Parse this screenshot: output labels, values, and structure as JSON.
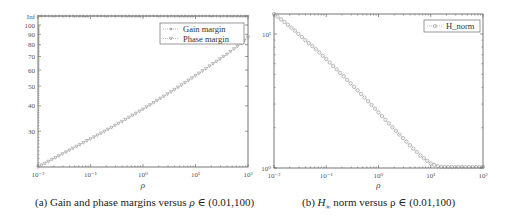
{
  "chart_data": [
    {
      "type": "line",
      "id": "a",
      "title": "",
      "caption": "(a) Gain and phase margins versus ρ ∈ (0.01,100)",
      "xlabel": "ρ",
      "ylabel": "",
      "xscale": "log",
      "yscale": "log",
      "xlim": [
        0.01,
        100
      ],
      "ylim": [
        20,
        "Inf"
      ],
      "xticks": [
        "10⁻²",
        "10⁻¹",
        "10⁰",
        "10¹",
        "10²"
      ],
      "yticks": [
        "30",
        "40",
        "50",
        "60",
        "70",
        "80",
        "90",
        "100",
        "Inf"
      ],
      "grid": false,
      "legend_position": "upper right",
      "legend": [
        "Gain margin",
        "Phase margin"
      ],
      "series": [
        {
          "name": "Gain margin",
          "marker": "asterisk",
          "line": "dotted",
          "values_note": "constant at Inf for all ρ",
          "x": [
            0.01,
            100
          ],
          "values": [
            "Inf",
            "Inf"
          ]
        },
        {
          "name": "Phase margin",
          "marker": "triangle-down",
          "line": "dotted",
          "x": [
            0.01,
            0.0158,
            0.0251,
            0.0398,
            0.0631,
            0.1,
            0.158,
            0.251,
            0.398,
            0.631,
            1,
            1.58,
            2.51,
            3.98,
            6.31,
            10,
            15.8,
            25.1,
            39.8,
            63.1,
            100
          ],
          "values": [
            20,
            21.3,
            22.7,
            24.2,
            25.8,
            27.5,
            29.3,
            31.3,
            33.5,
            35.9,
            38.5,
            41.4,
            44.6,
            48.1,
            52.0,
            56.3,
            61.0,
            66.2,
            71.8,
            78.5,
            87.0
          ]
        }
      ]
    },
    {
      "type": "line",
      "id": "b",
      "title": "",
      "caption": "(b) H∞ norm versus ρ ∈ (0.01,100)",
      "xlabel": "ρ",
      "ylabel": "",
      "xscale": "log",
      "yscale": "log",
      "xlim": [
        0.01,
        100
      ],
      "ylim": [
        1,
        14
      ],
      "xticks": [
        "10⁻²",
        "10⁻¹",
        "10⁰",
        "10¹",
        "10²"
      ],
      "yticks": [
        "10⁰",
        "10¹"
      ],
      "grid": false,
      "legend_position": "upper right",
      "legend": [
        "H_norm"
      ],
      "series": [
        {
          "name": "H_norm",
          "marker": "circle",
          "line": "dotted",
          "x": [
            0.01,
            0.0158,
            0.0251,
            0.0398,
            0.0631,
            0.1,
            0.158,
            0.251,
            0.398,
            0.631,
            1,
            1.58,
            2.51,
            3.98,
            6.31,
            10,
            15.8,
            25.1,
            39.8,
            63.1,
            100
          ],
          "values": [
            14.1,
            12.3,
            10.6,
            9.0,
            7.7,
            6.5,
            5.45,
            4.55,
            3.8,
            3.15,
            2.6,
            2.15,
            1.78,
            1.48,
            1.24,
            1.08,
            1.01,
            1.0,
            1.0,
            1.0,
            1.0
          ]
        }
      ]
    }
  ],
  "figure": {
    "caption_a_prefix": "(a) Gain and phase margins versus ",
    "caption_a_var": "ρ",
    "caption_a_suffix": " ∈ (0.01,100)",
    "caption_b_prefix": "(b) ",
    "caption_b_var": "H",
    "caption_b_sub": "∞",
    "caption_b_suffix": " norm versus ρ ∈ (0.01,100)",
    "marker_color": "#8a8a8a",
    "axis_color": "#555555"
  }
}
